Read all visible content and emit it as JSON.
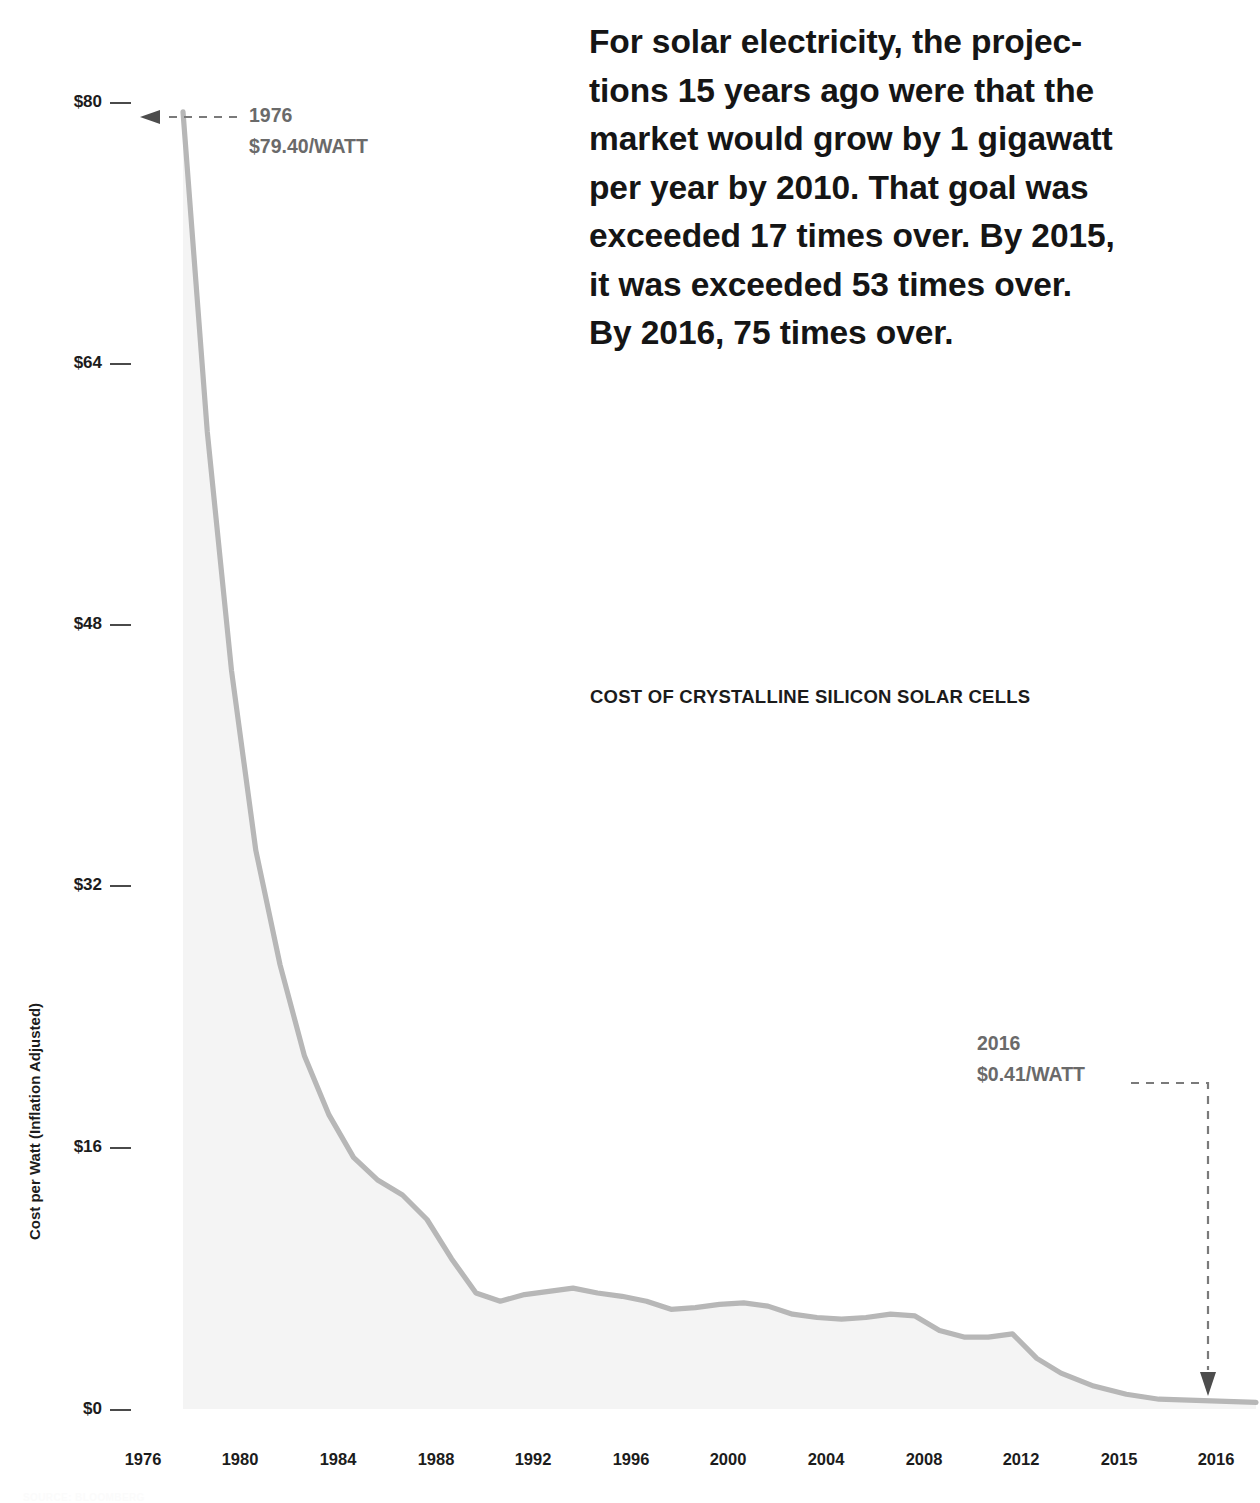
{
  "headline": {
    "lines": [
      "For solar electricity, the projec-",
      "tions 15 years ago were that the",
      "market would grow by 1 gigawatt",
      "per year by 2010. That goal was",
      "exceeded 17 times over. By 2015,",
      "it was exceeded 53 times over.",
      "By 2016, 75 times over."
    ]
  },
  "source_note": "SOURCE: BLOOMBERG",
  "annotations": {
    "start": {
      "year": "1976",
      "value": "$79.40/WATT"
    },
    "end": {
      "year": "2016",
      "value": "$0.41/WATT"
    }
  },
  "colors": {
    "line": "#b7b7b7",
    "fill": "#f4f4f4",
    "annotation_text": "#6a6a6a",
    "axis_text": "#1c1c1c",
    "headline_text": "#151515",
    "leader": "#7a7a7a"
  },
  "chart_data": {
    "type": "area",
    "title": "COST OF CRYSTALLINE SILICON SOLAR CELLS",
    "xlabel": "",
    "ylabel": "Cost per Watt (Inflation Adjusted)",
    "ylim": [
      0,
      80
    ],
    "grid": false,
    "legend": "none",
    "ytick_labels": [
      "$80",
      "$64",
      "$48",
      "$32",
      "$16",
      "$0"
    ],
    "ytick_values": [
      80,
      64,
      48,
      32,
      16,
      0
    ],
    "xtick_labels": [
      "1976",
      "1980",
      "1984",
      "1988",
      "1992",
      "1996",
      "2000",
      "2004",
      "2008",
      "2012",
      "2015",
      "2016"
    ],
    "x": [
      1976,
      1977,
      1978,
      1979,
      1980,
      1981,
      1982,
      1983,
      1984,
      1985,
      1986,
      1987,
      1988,
      1989,
      1990,
      1991,
      1992,
      1993,
      1994,
      1995,
      1996,
      1997,
      1998,
      1999,
      2000,
      2001,
      2002,
      2003,
      2004,
      2005,
      2006,
      2007,
      2008,
      2009,
      2010,
      2011,
      2012,
      2013,
      2014,
      2015,
      2016
    ],
    "values": [
      79.4,
      59.8,
      45.2,
      34.2,
      27.2,
      21.6,
      18.0,
      15.4,
      14.0,
      13.1,
      11.6,
      9.2,
      7.1,
      6.6,
      7.0,
      7.2,
      7.4,
      7.1,
      6.9,
      6.6,
      6.1,
      6.2,
      6.4,
      6.5,
      6.3,
      5.8,
      5.6,
      5.5,
      5.6,
      5.8,
      5.7,
      4.8,
      4.4,
      4.4,
      4.6,
      3.1,
      2.2,
      1.4,
      0.9,
      0.6,
      0.41
    ],
    "series_name": "Cost per Watt (Inflation Adjusted)",
    "units": "USD per watt, inflation adjusted",
    "annotations": [
      {
        "x": 1976,
        "y": 79.4,
        "label": "1976 $79.40/WATT"
      },
      {
        "x": 2016,
        "y": 0.41,
        "label": "2016 $0.41/WATT"
      }
    ]
  }
}
